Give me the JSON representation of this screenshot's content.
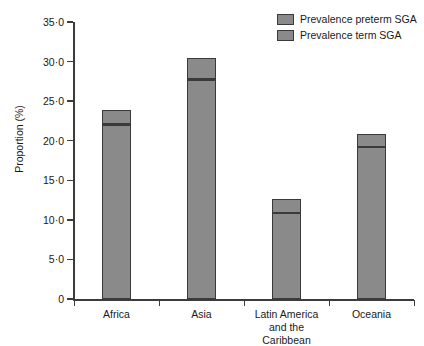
{
  "chart_data": {
    "type": "bar",
    "subtype": "stacked",
    "title": "",
    "xlabel": "",
    "ylabel": "Proportion (%)",
    "ylim": [
      0,
      35
    ],
    "ytick_values": [
      0,
      5,
      10,
      15,
      20,
      25,
      30,
      35
    ],
    "ytick_labels": [
      "0",
      "5·0",
      "10·0",
      "15·0",
      "20·0",
      "25·0",
      "30·0",
      "35·0"
    ],
    "grid": false,
    "legend_position": "top-right",
    "categories": [
      "Africa",
      "Asia",
      "Latin America\nand the Caribbean",
      "Oceania"
    ],
    "series": [
      {
        "name": "Prevalence term SGA",
        "color": "#8a8a8a",
        "values": [
          22.1,
          27.8,
          10.9,
          19.3
        ]
      },
      {
        "name": "Prevalence preterm SGA",
        "color": "#8a8a8a",
        "values": [
          1.8,
          2.7,
          1.7,
          1.6
        ]
      }
    ],
    "totals": [
      23.9,
      30.5,
      12.6,
      20.9
    ]
  },
  "legend": {
    "items": [
      {
        "label": "Prevalence preterm SGA",
        "color": "#8a8a8a"
      },
      {
        "label": "Prevalence term SGA",
        "color": "#8a8a8a"
      }
    ]
  },
  "axis": {
    "y_title": "Proportion (%)"
  }
}
